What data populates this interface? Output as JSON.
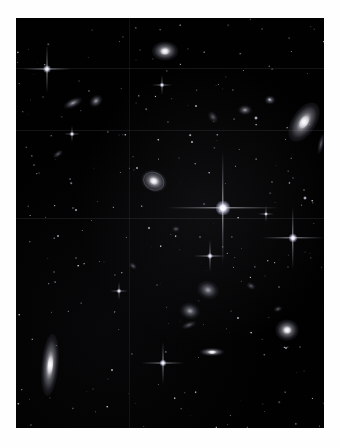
{
  "image": {
    "title": "Deep-field astronomical image of a galaxy cluster",
    "alt_text": "Black sky deep-field exposure showing foreground stars with four-point diffraction spikes and dozens of background galaxies",
    "frame": {
      "x": 16,
      "y": 18,
      "width": 308,
      "height": 410
    },
    "border_color": "#ffffff",
    "sky_color": "#010101",
    "star_color": "#ffffff",
    "galaxy_color": "#e8e8f0"
  },
  "chart_data": {
    "type": "scatter",
    "title": "Deep-field astronomical image of a galaxy cluster",
    "xlabel": "",
    "ylabel": "",
    "xlim": [
      0,
      308
    ],
    "ylim": [
      0,
      410
    ],
    "grid": false,
    "legend": "none",
    "annotations": [
      "Bright foreground star with four-point diffraction spikes near image centre",
      "Large edge-on spiral galaxy at lower left",
      "Inclined lenticular galaxy at right edge",
      "Faint horizontal detector seams cross the frame"
    ],
    "seams": {
      "horizontal_y": [
        50,
        112,
        200
      ],
      "vertical_x": [
        113
      ]
    },
    "series": [
      {
        "name": "stars",
        "description": "Foreground point sources; spike length scales with brightness",
        "points": [
          {
            "x": 207,
            "y": 190,
            "size": 15,
            "brightness": 1.0,
            "spike": 112
          },
          {
            "x": 277,
            "y": 220,
            "size": 9,
            "brightness": 0.85,
            "spike": 62
          },
          {
            "x": 31,
            "y": 51,
            "size": 8,
            "brightness": 0.8,
            "spike": 48
          },
          {
            "x": 147,
            "y": 345,
            "size": 7,
            "brightness": 0.78,
            "spike": 42
          },
          {
            "x": 194,
            "y": 238,
            "size": 6,
            "brightness": 0.7,
            "spike": 32
          },
          {
            "x": 146,
            "y": 67,
            "size": 5,
            "brightness": 0.55,
            "spike": 20
          },
          {
            "x": 250,
            "y": 196,
            "size": 4,
            "brightness": 0.5,
            "spike": 16
          },
          {
            "x": 103,
            "y": 273,
            "size": 5,
            "brightness": 0.55,
            "spike": 18
          },
          {
            "x": 56,
            "y": 116,
            "size": 5,
            "brightness": 0.55,
            "spike": 16
          },
          {
            "x": 289,
            "y": 180,
            "size": 4,
            "brightness": 0.45,
            "spike": 0
          },
          {
            "x": 176,
            "y": 124,
            "size": 3,
            "brightness": 0.4,
            "spike": 0
          },
          {
            "x": 60,
            "y": 192,
            "size": 3,
            "brightness": 0.38,
            "spike": 0
          },
          {
            "x": 240,
            "y": 100,
            "size": 4,
            "brightness": 0.45,
            "spike": 0
          },
          {
            "x": 133,
            "y": 210,
            "size": 3,
            "brightness": 0.35,
            "spike": 0
          },
          {
            "x": 222,
            "y": 300,
            "size": 3,
            "brightness": 0.35,
            "spike": 0
          },
          {
            "x": 96,
            "y": 352,
            "size": 3,
            "brightness": 0.35,
            "spike": 0
          },
          {
            "x": 270,
            "y": 330,
            "size": 3,
            "brightness": 0.3,
            "spike": 0
          },
          {
            "x": 42,
            "y": 218,
            "size": 3,
            "brightness": 0.3,
            "spike": 0
          },
          {
            "x": 180,
            "y": 88,
            "size": 3,
            "brightness": 0.32,
            "spike": 0
          },
          {
            "x": 121,
            "y": 150,
            "size": 3,
            "brightness": 0.3,
            "spike": 0
          }
        ]
      },
      {
        "name": "galaxies",
        "description": "Resolved extended sources: ellipticals, spirals and edge-on disks",
        "points": [
          {
            "x": 34,
            "y": 347,
            "w": 17,
            "h": 62,
            "rot": 5,
            "kind": "elliptical",
            "label": "edge-on-spiral-lower-left"
          },
          {
            "x": 288,
            "y": 104,
            "w": 24,
            "h": 44,
            "rot": 33,
            "kind": "elliptical",
            "label": "inclined-lenticular-right"
          },
          {
            "x": 149,
            "y": 33,
            "w": 26,
            "h": 19,
            "rot": 0,
            "kind": "elliptical",
            "label": "bright-elliptical-top"
          },
          {
            "x": 271,
            "y": 312,
            "w": 23,
            "h": 21,
            "rot": 0,
            "kind": "elliptical",
            "label": "round-elliptical-lower-right"
          },
          {
            "x": 138,
            "y": 163,
            "w": 26,
            "h": 21,
            "rot": 25,
            "kind": "spiral",
            "label": "face-on-spiral-centre-left"
          },
          {
            "x": 192,
            "y": 272,
            "w": 22,
            "h": 18,
            "rot": 20,
            "kind": "diffuse",
            "label": "elliptical-group-upper"
          },
          {
            "x": 174,
            "y": 293,
            "w": 20,
            "h": 16,
            "rot": 15,
            "kind": "diffuse",
            "label": "elliptical-group-lower"
          },
          {
            "x": 196,
            "y": 334,
            "w": 24,
            "h": 8,
            "rot": 0,
            "kind": "elliptical",
            "label": "edge-on-disk-centre-bottom"
          },
          {
            "x": 57,
            "y": 85,
            "w": 20,
            "h": 9,
            "rot": -25,
            "kind": "diffuse",
            "label": "elongated-galaxy-upper-left-a"
          },
          {
            "x": 80,
            "y": 83,
            "w": 14,
            "h": 11,
            "rot": -40,
            "kind": "diffuse",
            "label": "elongated-galaxy-upper-left-b"
          },
          {
            "x": 229,
            "y": 92,
            "w": 14,
            "h": 10,
            "rot": 0,
            "kind": "diffuse",
            "label": "small-elliptical-upper-right"
          },
          {
            "x": 254,
            "y": 82,
            "w": 11,
            "h": 9,
            "rot": 0,
            "kind": "diffuse",
            "label": "compact-galaxy-upper-right"
          },
          {
            "x": 197,
            "y": 99,
            "w": 13,
            "h": 9,
            "rot": 55,
            "kind": "faint",
            "label": "faint-galaxy-upper-centre"
          },
          {
            "x": 305,
            "y": 126,
            "w": 6,
            "h": 22,
            "rot": 12,
            "kind": "faint",
            "label": "sliver-galaxy-right-edge"
          },
          {
            "x": 173,
            "y": 307,
            "w": 16,
            "h": 7,
            "rot": -20,
            "kind": "faint",
            "label": "faint-disk-centre"
          },
          {
            "x": 42,
            "y": 136,
            "w": 12,
            "h": 6,
            "rot": -35,
            "kind": "faint",
            "label": "faint-galaxy-left"
          },
          {
            "x": 235,
            "y": 268,
            "w": 10,
            "h": 7,
            "rot": 30,
            "kind": "faint",
            "label": "faint-galaxy-right-centre"
          },
          {
            "x": 262,
            "y": 291,
            "w": 9,
            "h": 6,
            "rot": -15,
            "kind": "faint",
            "label": "faint-galaxy-lower-right"
          },
          {
            "x": 117,
            "y": 248,
            "w": 9,
            "h": 6,
            "rot": 40,
            "kind": "faint",
            "label": "faint-galaxy-mid-left"
          },
          {
            "x": 160,
            "y": 211,
            "w": 8,
            "h": 6,
            "rot": 0,
            "kind": "faint",
            "label": "faint-galaxy-centre"
          }
        ]
      },
      {
        "name": "background_sources",
        "description": "Unresolved faint field objects rendered as sub-pixel specks",
        "count": 320
      }
    ]
  }
}
